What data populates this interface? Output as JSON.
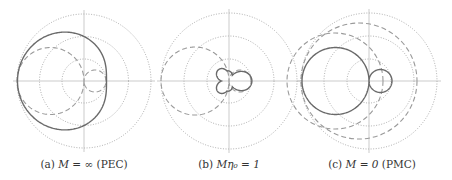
{
  "figure": {
    "panels": [
      {
        "id": "a",
        "caption_prefix": "(a)",
        "caption_math": "M = ∞",
        "caption_suffix": "(PEC)",
        "center": [
          84,
          81
        ],
        "ring_radii": [
          22,
          44.5,
          67
        ],
        "solid_curve": {
          "type": "limacon",
          "a": 44.5,
          "b": 22,
          "phase": 180
        },
        "dashed_curve": {
          "type": "twolobe",
          "big": 67,
          "small": 22
        }
      },
      {
        "id": "b",
        "caption_prefix": "(b)",
        "caption_math": "Mη₀ = 1",
        "caption_suffix": "",
        "center": [
          229,
          81
        ],
        "ring_radii": [
          22,
          45,
          68
        ],
        "solid_curve": {
          "type": "trefoil",
          "r": 21
        },
        "dashed_curve": {
          "type": "twolobe",
          "big": 68,
          "small": 22
        }
      },
      {
        "id": "c",
        "caption_prefix": "(c)",
        "caption_math": "M = 0",
        "caption_suffix": "(PMC)",
        "center": [
          369,
          81
        ],
        "ring_radii": [
          22,
          45,
          68
        ],
        "solid_curve": {
          "type": "twolobe",
          "big": 67,
          "small": 23
        },
        "dashed_curve": {
          "type": "twocircles",
          "r1": 68,
          "r2": 45
        }
      }
    ],
    "colors": {
      "grid": "#8a8a8a",
      "solid": "#6a6a6a",
      "dashed": "#9a9a9a",
      "caption": "#333333"
    }
  }
}
